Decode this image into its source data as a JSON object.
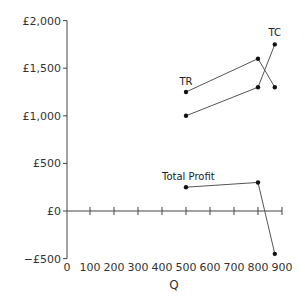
{
  "chart_data": {
    "type": "line",
    "title": "",
    "xlabel": "Q",
    "ylabel": "",
    "xlim": [
      0,
      900
    ],
    "ylim": [
      -500,
      2000
    ],
    "x_ticks": [
      0,
      100,
      200,
      300,
      400,
      500,
      600,
      700,
      800,
      900
    ],
    "x_tick_labels": [
      "0",
      "100",
      "200",
      "300",
      "400",
      "500",
      "600",
      "700",
      "800",
      "900"
    ],
    "y_ticks": [
      -500,
      0,
      500,
      1000,
      1500,
      2000
    ],
    "y_tick_labels": [
      "−£500",
      "£0",
      "£500",
      "£1,000",
      "£1,500",
      "£2,000"
    ],
    "grid": false,
    "legend": "none (series labeled inline)",
    "series": [
      {
        "name": "TR",
        "x": [
          500,
          800,
          870
        ],
        "values": [
          1250,
          1600,
          1300
        ],
        "label_position": "above first point"
      },
      {
        "name": "TC",
        "x": [
          500,
          800,
          870
        ],
        "values": [
          1000,
          1300,
          1750
        ],
        "label_position": "above last point"
      },
      {
        "name": "Total Profit",
        "x": [
          500,
          800,
          870
        ],
        "values": [
          250,
          300,
          -450
        ],
        "label_position": "above first point"
      }
    ]
  }
}
